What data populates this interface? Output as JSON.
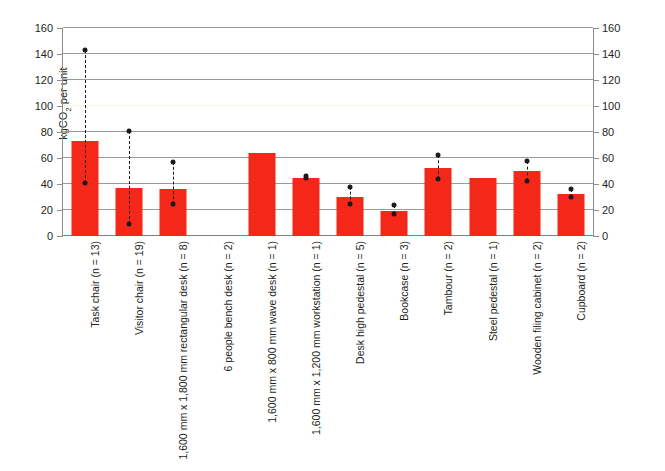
{
  "chart_data": {
    "type": "bar",
    "title": "",
    "xlabel": "",
    "ylabel": "kgCO2 per unit",
    "ylabel_html": "kgCO<sub>2</sub> per unit",
    "ylim": [
      0,
      160
    ],
    "y_ticks": [
      0,
      20,
      40,
      60,
      80,
      100,
      120,
      140,
      160
    ],
    "y_ticks_right": [
      0,
      20,
      40,
      60,
      80,
      100,
      120,
      140,
      160
    ],
    "grid": true,
    "legend": "none",
    "bar_color": "#f42718",
    "error_bar_color": "#1a1a1a",
    "axis_color": "#8d8d8d",
    "gridline_color": "#9a9a9a",
    "categories": [
      "Task chair (n = 13)",
      "Visitor chair (n = 19)",
      "1,600 mm x 1,800 mm rectangular desk (n = 8)",
      "6 people bench desk (n = 2)",
      "1,600 mm x 800 mm wave desk (n = 1)",
      "1,600 mm x 1,200 mm workstation (n = 1)",
      "Desk high pedestal (n = 5)",
      "Bookcase (n = 3)",
      "Tambour (n = 2)",
      "Steel pedestal (n = 1)",
      "Wooden filing cabinet (n = 2)",
      "Cupboard (n = 2)"
    ],
    "values": [
      73,
      37,
      36,
      null,
      64,
      45,
      30,
      19,
      52,
      45,
      50,
      32
    ],
    "error_low": [
      41,
      9,
      25,
      null,
      null,
      45,
      25,
      17,
      44,
      null,
      42,
      30
    ],
    "error_high": [
      143,
      81,
      57,
      null,
      null,
      46,
      38,
      24,
      62,
      null,
      58,
      36
    ]
  }
}
